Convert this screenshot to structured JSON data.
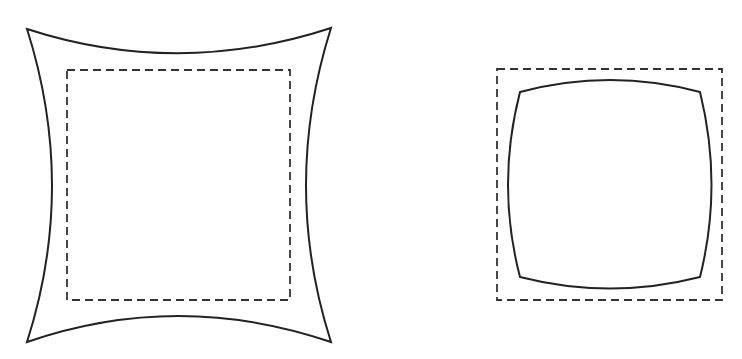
{
  "diagram": {
    "type": "lens-distortion-comparison",
    "figures": [
      {
        "name": "pincushion-distortion",
        "reference_rect": {
          "x": 67,
          "y": 70,
          "width": 223,
          "height": 230,
          "style": "dashed"
        },
        "distorted_shape": "concave-sided square (corners pulled outward)"
      },
      {
        "name": "barrel-distortion",
        "reference_rect": {
          "x": 497,
          "y": 69,
          "width": 225,
          "height": 231,
          "style": "dashed"
        },
        "distorted_shape": "convex-sided square (sides bulging outward)"
      }
    ],
    "colors": {
      "stroke": "#222222",
      "background": "#ffffff"
    }
  }
}
